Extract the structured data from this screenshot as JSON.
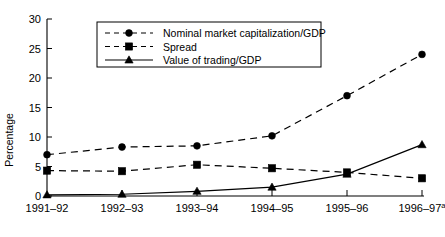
{
  "chart_data": {
    "type": "line",
    "title": "",
    "xlabel": "",
    "ylabel": "Percentage",
    "ylim": [
      0,
      30
    ],
    "yticks": [
      0,
      5,
      10,
      15,
      20,
      25,
      30
    ],
    "ytick_labels": [
      "0",
      "5",
      "10",
      "15",
      "20",
      "25",
      "30"
    ],
    "grid": false,
    "legend_position": "top-center",
    "categories": [
      "1991–92",
      "1992–93",
      "1993–94",
      "1994–95",
      "1995–96",
      "1996–97"
    ],
    "category_superscripts": [
      "",
      "",
      "",
      "",
      "",
      "a"
    ],
    "series": [
      {
        "name": "Nominal market capitalization/GDP",
        "values": [
          7.0,
          8.3,
          8.5,
          10.2,
          17.0,
          24.0
        ],
        "marker": "circle",
        "line_style": "dashed",
        "color": "#000000"
      },
      {
        "name": "Spread",
        "values": [
          4.3,
          4.2,
          5.3,
          4.7,
          4.0,
          3.0
        ],
        "marker": "square",
        "line_style": "dashed",
        "color": "#000000"
      },
      {
        "name": "Value of trading/GDP",
        "values": [
          0.2,
          0.3,
          0.8,
          1.5,
          3.7,
          8.7
        ],
        "marker": "triangle",
        "line_style": "solid",
        "color": "#000000"
      }
    ]
  },
  "legend": {
    "entries": [
      {
        "label": "Nominal market capitalization/GDP"
      },
      {
        "label": "Spread"
      },
      {
        "label": "Value of trading/GDP"
      }
    ]
  }
}
